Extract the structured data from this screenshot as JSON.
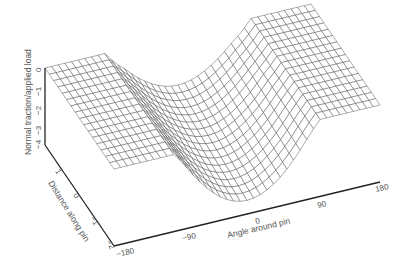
{
  "chart_data": {
    "type": "surface3d",
    "title": "",
    "zlabel": "Normal traction/applied load",
    "ylabel": "Distance along pin",
    "xlabel": "Angle around pin",
    "z_ticks": [
      "0",
      "-1",
      "-2",
      "-3",
      "-4"
    ],
    "y_ticks": [
      "2",
      "1",
      "0",
      "-1",
      "-2"
    ],
    "x_ticks": [
      "-180",
      "-90",
      "0",
      "90",
      "180"
    ],
    "zlim": [
      -4,
      0
    ],
    "ylim": [
      -2,
      2
    ],
    "xlim": [
      -180,
      180
    ],
    "grid": false,
    "surface_profile": {
      "angles": [
        -180,
        -135,
        -90,
        -60,
        -30,
        0,
        30,
        60,
        90,
        135,
        180
      ],
      "traction_at_mid_distance": [
        0,
        0,
        -0.3,
        -1.8,
        -3.0,
        -3.4,
        -3.0,
        -1.8,
        -0.3,
        0,
        0
      ]
    }
  },
  "labels": {
    "z_axis": "Normal traction/applied load",
    "y_axis": "Distance along pin",
    "x_axis": "Angle around pin"
  }
}
